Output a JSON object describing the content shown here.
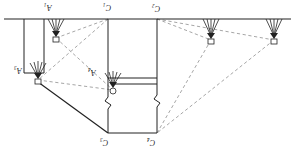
{
  "figure": {
    "kind": "engineering-section-diagram",
    "width": 295,
    "height": 159,
    "background": "#ffffff",
    "stroke_solid": "#222222",
    "stroke_dashed": "#8a8a8a",
    "orientation_note": "labels printed inverted"
  },
  "labels": {
    "anchor_1": "A₁",
    "anchor_2": "A₂",
    "anchor_3": "A₃",
    "anchor_4": "A₄",
    "point_c1": "C₁",
    "point_c2": "C₂",
    "point_c3": "C₃",
    "point_c4": "C₄"
  },
  "label_positions": [
    {
      "name": "anchor-label-a1",
      "key": "anchor_1",
      "x": 44,
      "y": 3
    },
    {
      "name": "point-label-c1",
      "key": "point_c1",
      "x": 103,
      "y": 3
    },
    {
      "name": "point-label-c2",
      "key": "point_c2",
      "x": 152,
      "y": 4
    },
    {
      "name": "anchor-label-a3",
      "key": "anchor_3",
      "x": 14,
      "y": 66
    },
    {
      "name": "anchor-label-a4",
      "key": "anchor_4",
      "x": 88,
      "y": 68
    },
    {
      "name": "point-label-c3",
      "key": "point_c3",
      "x": 100,
      "y": 138
    },
    {
      "name": "point-label-c4",
      "key": "point_c4",
      "x": 147,
      "y": 138
    }
  ],
  "nodes": {
    "surface_y": 19,
    "anchor_heads": [
      {
        "name": "anchor-head-a1",
        "x": 56,
        "y": 37
      },
      {
        "name": "anchor-head-a3",
        "x": 38,
        "y": 79
      },
      {
        "name": "anchor-head-a4",
        "x": 113,
        "y": 88
      },
      {
        "name": "anchor-head-right-1",
        "x": 211,
        "y": 39
      },
      {
        "name": "anchor-head-right-2",
        "x": 274,
        "y": 39
      }
    ],
    "corners": [
      {
        "name": "corner-c1-top",
        "x": 108,
        "y": 19
      },
      {
        "name": "corner-c2-top",
        "x": 157,
        "y": 19
      },
      {
        "name": "corner-c3-bottom",
        "x": 108,
        "y": 133
      },
      {
        "name": "corner-c4-bottom",
        "x": 157,
        "y": 133
      }
    ],
    "shaft_left": {
      "x1": 24,
      "x2": 44,
      "y1": 19,
      "y2": 73
    },
    "ledge_y": 78
  },
  "elements": {
    "ground_surface": "ground-surface-line",
    "break_symbols": 2,
    "dashed_sightlines": 8,
    "solid_members": 9
  }
}
